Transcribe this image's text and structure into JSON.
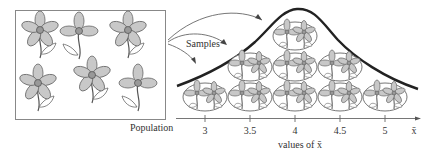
{
  "population": {
    "label": "Population",
    "flower_count": 6
  },
  "samples_label": "Samples",
  "axis": {
    "ticks": [
      {
        "label": "3",
        "x": 205
      },
      {
        "label": "3.5",
        "x": 250
      },
      {
        "label": "4",
        "x": 295
      },
      {
        "label": "4.5",
        "x": 340
      },
      {
        "label": "5",
        "x": 385
      }
    ],
    "end_label": "x̄",
    "title": "values of x̄"
  },
  "sample_groups": [
    {
      "row": "bottom",
      "x_value": "3"
    },
    {
      "row": "bottom",
      "x_value": "3.5"
    },
    {
      "row": "middle",
      "x_value": "3.5"
    },
    {
      "row": "bottom",
      "x_value": "4"
    },
    {
      "row": "middle",
      "x_value": "4"
    },
    {
      "row": "top",
      "x_value": "4"
    },
    {
      "row": "bottom",
      "x_value": "4.5"
    },
    {
      "row": "middle",
      "x_value": "4.5"
    },
    {
      "row": "bottom",
      "x_value": "5"
    }
  ],
  "colors": {
    "line": "#222222",
    "petal_fill": "#c8c8c8",
    "outline": "#555555"
  }
}
